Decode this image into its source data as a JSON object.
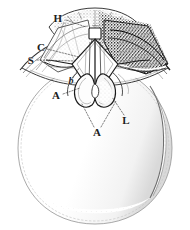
{
  "figure": {
    "kind": "anatomical-engraving",
    "background_color": "#ffffff",
    "ink_color": "#1c1c1c",
    "mid_tone_color": "#6f6f6f",
    "light_tone_color": "#b4b4b4",
    "faint_tone_color": "#d8d8d8",
    "width": 190,
    "height": 230
  },
  "labels": [
    {
      "id": "label-h",
      "text": "H",
      "style": "roman",
      "x": 58,
      "y": 18,
      "leader": {
        "from_x": 66,
        "from_y": 20,
        "to_x": 86,
        "to_y": 27
      }
    },
    {
      "id": "label-c",
      "text": "C",
      "style": "roman",
      "x": 41,
      "y": 47,
      "leader": {
        "from_x": 47,
        "from_y": 49,
        "to_x": 79,
        "to_y": 57
      }
    },
    {
      "id": "label-s",
      "text": "S",
      "style": "roman",
      "x": 31,
      "y": 60,
      "leader": {
        "from_x": 37,
        "from_y": 60,
        "to_x": 75,
        "to_y": 61
      }
    },
    {
      "id": "label-b",
      "text": "b",
      "style": "italic",
      "x": 71,
      "y": 81,
      "leader": {
        "from_x": 73,
        "from_y": 78,
        "to_x": 79,
        "to_y": 68
      }
    },
    {
      "id": "label-a-upper",
      "text": "A",
      "style": "roman",
      "x": 56,
      "y": 95,
      "leader": {
        "from_x": 63,
        "from_y": 94,
        "to_x": 80,
        "to_y": 88
      }
    },
    {
      "id": "label-a-lower",
      "text": "A",
      "style": "roman",
      "x": 97,
      "y": 132,
      "leader_left": {
        "from_x": 94,
        "from_y": 127,
        "to_x": 82,
        "to_y": 104
      },
      "leader_right": {
        "from_x": 101,
        "from_y": 127,
        "to_x": 116,
        "to_y": 101
      }
    },
    {
      "id": "label-l",
      "text": "L",
      "style": "roman",
      "x": 126,
      "y": 120,
      "leader": {
        "from_x": 124,
        "from_y": 115,
        "to_x": 112,
        "to_y": 97
      }
    }
  ]
}
